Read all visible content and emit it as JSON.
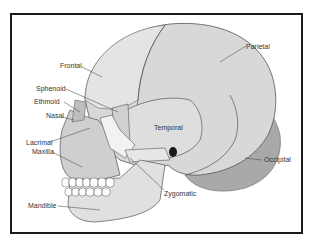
{
  "diagram": {
    "type": "labeled-anatomy",
    "colors": {
      "frame": "#1a1a1a",
      "bone_light": "#dcdcdc",
      "bone_mid": "#cfcfcf",
      "occipital": "#a9a9a9",
      "face_highlight": "#f2f2f2",
      "suture": "#555555",
      "leader": "#555555"
    },
    "labels": [
      {
        "id": "frontal",
        "text": "Frontal"
      },
      {
        "id": "parietal",
        "text": "Parietal"
      },
      {
        "id": "sphenoid",
        "text": "Sphenoid"
      },
      {
        "id": "ethmoid",
        "text": "Ethmoid"
      },
      {
        "id": "nasal",
        "text": "Nasal"
      },
      {
        "id": "temporal",
        "text": "Temporal"
      },
      {
        "id": "lacrimal",
        "text": "Lacrimal"
      },
      {
        "id": "maxilla",
        "text": "Maxilla"
      },
      {
        "id": "occipital",
        "text": "Occipital"
      },
      {
        "id": "zygomatic",
        "text": "Zygomatic"
      },
      {
        "id": "mandible",
        "text": "Mandible"
      }
    ]
  }
}
